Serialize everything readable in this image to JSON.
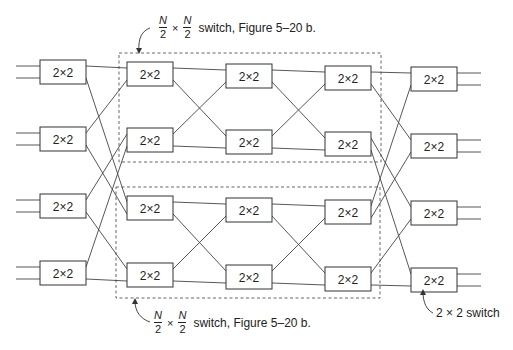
{
  "diagram": {
    "switch_label": "2×2",
    "stages": [
      {
        "x": 40,
        "rows": [
          60,
          127,
          194,
          261
        ]
      },
      {
        "x": 127,
        "rows": [
          62,
          128,
          196,
          263
        ]
      },
      {
        "x": 226,
        "rows": [
          64,
          130,
          198,
          265
        ]
      },
      {
        "x": 325,
        "rows": [
          66,
          132,
          200,
          267
        ]
      },
      {
        "x": 411,
        "rows": [
          67,
          134,
          201,
          268
        ]
      }
    ],
    "box": {
      "width": 46,
      "height": 24
    }
  },
  "annotations": {
    "top": {
      "numerator": "N",
      "denominator": "2",
      "times": "×",
      "text": "switch, Figure 5–20 b."
    },
    "bottom": {
      "numerator": "N",
      "denominator": "2",
      "times": "×",
      "text": "switch, Figure 5–20 b."
    },
    "switch_callout": "2 × 2 switch"
  }
}
